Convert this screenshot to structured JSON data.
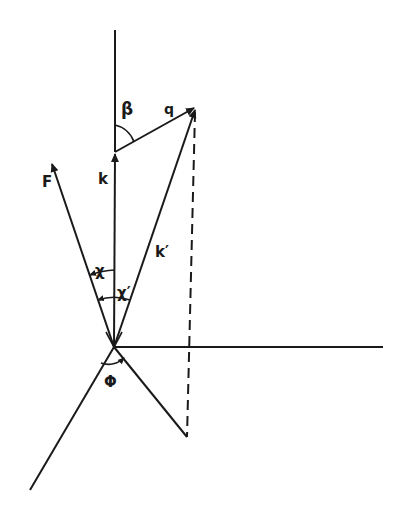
{
  "diagram": {
    "type": "vector-geometry",
    "labels": {
      "beta": "β",
      "q": "q",
      "k": "k",
      "F": "F",
      "k_prime": "k′",
      "chi": "χ",
      "chi_prime": "χ′",
      "phi": "Φ"
    },
    "colors": {
      "ink": "#1a1a1a",
      "background": "#ffffff"
    }
  }
}
